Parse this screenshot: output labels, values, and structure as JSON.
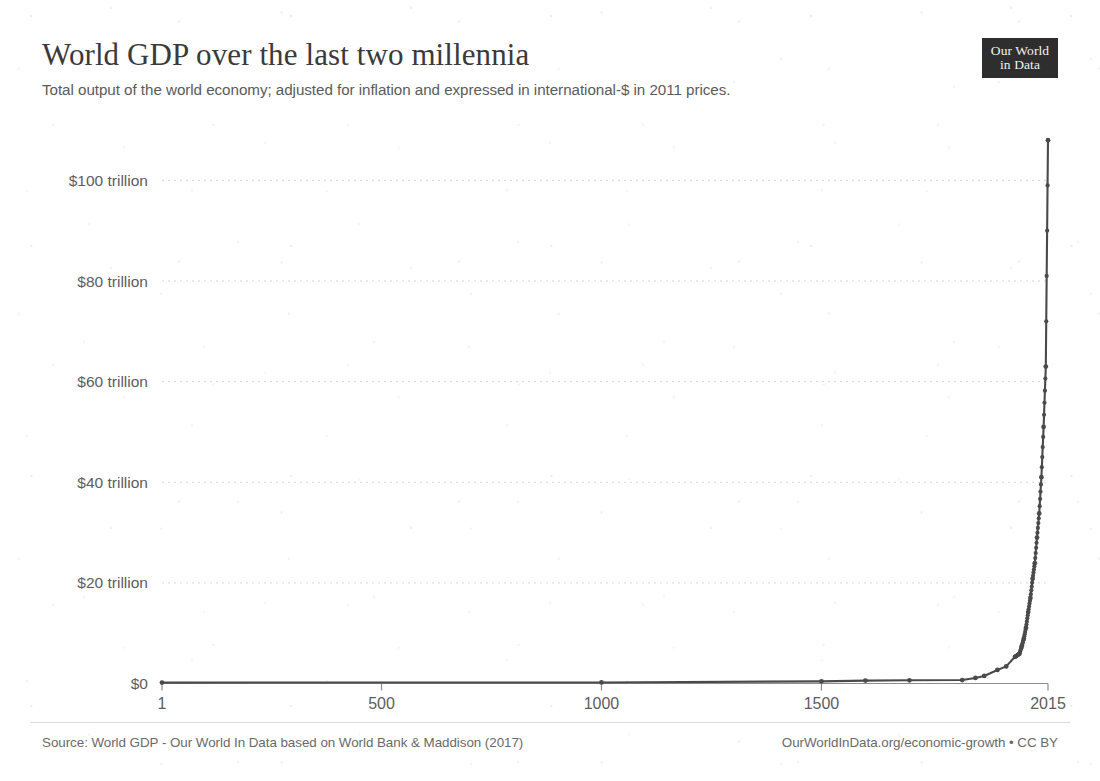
{
  "header": {
    "title": "World GDP over the last two millennia",
    "subtitle": "Total output of the world economy; adjusted for inflation and expressed in international-$ in 2011 prices."
  },
  "logo": {
    "line1": "Our World",
    "line2": "in Data"
  },
  "footer": {
    "source": "Source: World GDP - Our World In Data based on World Bank & Maddison (2017)",
    "link": "OurWorldInData.org/economic-growth • CC BY"
  },
  "chart_data": {
    "type": "line",
    "title": "World GDP over the last two millennia",
    "subtitle": "Total output of the world economy; adjusted for inflation and expressed in international-$ in 2011 prices.",
    "xlabel": "",
    "ylabel": "",
    "xlim": [
      1,
      2015
    ],
    "ylim": [
      0,
      112
    ],
    "y_unit": "trillion international-$ (2011 prices)",
    "grid": "horizontal-dotted",
    "legend": "none",
    "line_color": "#4a4a4a",
    "marker": "circle",
    "x_ticks": [
      1,
      500,
      1000,
      1500,
      2015
    ],
    "x_tick_labels": [
      "1",
      "500",
      "1000",
      "1500",
      "2015"
    ],
    "y_ticks": [
      0,
      20,
      40,
      60,
      80,
      100
    ],
    "y_tick_labels": [
      "$0",
      "$20 trillion",
      "$40 trillion",
      "$60 trillion",
      "$80 trillion",
      "$100 trillion"
    ],
    "x": [
      1,
      1000,
      1500,
      1600,
      1700,
      1820,
      1850,
      1870,
      1900,
      1920,
      1940,
      1950,
      1955,
      1960,
      1965,
      1970,
      1975,
      1980,
      1985,
      1990,
      1995,
      2000,
      2005,
      2010,
      2015
    ],
    "values": [
      0.18,
      0.21,
      0.43,
      0.58,
      0.64,
      0.69,
      1.1,
      1.5,
      2.7,
      3.4,
      5.3,
      5.9,
      7.3,
      8.9,
      11.1,
      14.2,
      17.0,
      20.8,
      23.9,
      29.0,
      33.8,
      41.0,
      51.0,
      63.0,
      108.0
    ]
  }
}
